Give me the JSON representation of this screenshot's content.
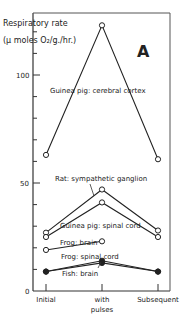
{
  "chart_data": {
    "type": "line",
    "panel_label": "A",
    "ylabel_line1": "Respiratory rate",
    "ylabel_line2": "(μ moles O₂/g./hr.)",
    "xlabel": "",
    "categories": [
      "Initial",
      "with pulses",
      "Subsequent"
    ],
    "category_labels": [
      {
        "lines": [
          "Initial"
        ]
      },
      {
        "lines": [
          "with",
          "pulses"
        ]
      },
      {
        "lines": [
          "Subsequent"
        ]
      }
    ],
    "ylim": [
      0,
      128
    ],
    "yticks": [
      0,
      50,
      100
    ],
    "ytick_labels": [
      "0",
      "50",
      "100"
    ],
    "minor_tick_step": 10,
    "grid": false,
    "series": [
      {
        "name": "Guinea pig: cerebral cortex",
        "values": [
          63,
          123,
          61
        ],
        "marker": "open"
      },
      {
        "name": "Rat: sympathetic ganglion",
        "values": [
          27,
          47,
          28
        ],
        "marker": "open"
      },
      {
        "name": "Guinea pig: spinal cord",
        "values": [
          25,
          41,
          25
        ],
        "marker": "open"
      },
      {
        "name": "Frog: brain",
        "values": [
          19,
          23,
          null
        ],
        "marker": "open"
      },
      {
        "name": "Frog: spinal cord",
        "values": [
          9,
          14,
          9
        ],
        "marker": "filled"
      },
      {
        "name": "Fish: brain",
        "values": [
          9,
          13,
          9
        ],
        "marker": "filled"
      }
    ]
  }
}
